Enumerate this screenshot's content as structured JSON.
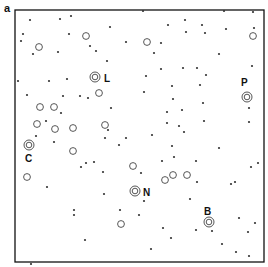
{
  "panel_label": "a",
  "frame": {
    "x": 15,
    "y": 10,
    "w": 249,
    "h": 252,
    "stroke": "#111111"
  },
  "colors": {
    "dot": "#333333",
    "ring": "#444444",
    "label": "#111111"
  },
  "dots": [
    [
      30,
      20
    ],
    [
      60,
      19
    ],
    [
      71,
      16
    ],
    [
      110,
      27
    ],
    [
      126,
      42
    ],
    [
      23,
      34
    ],
    [
      21,
      41
    ],
    [
      33,
      54
    ],
    [
      58,
      52
    ],
    [
      69,
      34
    ],
    [
      90,
      46
    ],
    [
      96,
      51
    ],
    [
      107,
      61
    ],
    [
      18,
      81
    ],
    [
      49,
      81
    ],
    [
      67,
      79
    ],
    [
      27,
      95
    ],
    [
      63,
      96
    ],
    [
      80,
      96
    ],
    [
      88,
      98
    ],
    [
      61,
      113
    ],
    [
      111,
      108
    ],
    [
      46,
      121
    ],
    [
      108,
      130
    ],
    [
      143,
      11
    ],
    [
      185,
      20
    ],
    [
      224,
      11
    ],
    [
      226,
      29
    ],
    [
      202,
      25
    ],
    [
      168,
      25
    ],
    [
      219,
      54
    ],
    [
      253,
      12
    ],
    [
      254,
      28
    ],
    [
      161,
      43
    ],
    [
      186,
      32
    ],
    [
      205,
      33
    ],
    [
      154,
      53
    ],
    [
      161,
      69
    ],
    [
      183,
      68
    ],
    [
      197,
      68
    ],
    [
      252,
      66
    ],
    [
      146,
      76
    ],
    [
      206,
      75
    ],
    [
      172,
      86
    ],
    [
      200,
      85
    ],
    [
      144,
      92
    ],
    [
      249,
      108
    ],
    [
      173,
      99
    ],
    [
      203,
      103
    ],
    [
      167,
      112
    ],
    [
      182,
      110
    ],
    [
      204,
      121
    ],
    [
      167,
      123
    ],
    [
      179,
      126
    ],
    [
      249,
      122
    ],
    [
      184,
      132
    ],
    [
      36,
      136
    ],
    [
      54,
      142
    ],
    [
      105,
      138
    ],
    [
      126,
      138
    ],
    [
      119,
      145
    ],
    [
      94,
      162
    ],
    [
      86,
      163
    ],
    [
      81,
      167
    ],
    [
      103,
      172
    ],
    [
      47,
      187
    ],
    [
      104,
      194
    ],
    [
      74,
      210
    ],
    [
      120,
      210
    ],
    [
      74,
      215
    ],
    [
      85,
      240
    ],
    [
      31,
      264
    ],
    [
      152,
      135
    ],
    [
      172,
      146
    ],
    [
      162,
      161
    ],
    [
      174,
      157
    ],
    [
      196,
      161
    ],
    [
      197,
      182
    ],
    [
      190,
      199
    ],
    [
      219,
      148
    ],
    [
      251,
      167
    ],
    [
      258,
      163
    ],
    [
      141,
      173
    ],
    [
      231,
      184
    ],
    [
      144,
      201
    ],
    [
      139,
      215
    ],
    [
      163,
      228
    ],
    [
      196,
      230
    ],
    [
      235,
      182
    ],
    [
      255,
      223
    ],
    [
      151,
      249
    ],
    [
      171,
      238
    ],
    [
      212,
      231
    ],
    [
      239,
      218
    ],
    [
      248,
      232
    ],
    [
      236,
      252
    ],
    [
      249,
      256
    ],
    [
      222,
      244
    ]
  ],
  "rings": [
    [
      39,
      47
    ],
    [
      86,
      36
    ],
    [
      147,
      42
    ],
    [
      99,
      93
    ],
    [
      40,
      107
    ],
    [
      54,
      107
    ],
    [
      37,
      124
    ],
    [
      55,
      129
    ],
    [
      73,
      128
    ],
    [
      105,
      125
    ],
    [
      27,
      177
    ],
    [
      73,
      151
    ],
    [
      133,
      166
    ],
    [
      165,
      180
    ],
    [
      173,
      175
    ],
    [
      187,
      175
    ],
    [
      121,
      224
    ],
    [
      253,
      36
    ]
  ],
  "labeled_stars": [
    {
      "label": "L",
      "x": 95,
      "y": 77,
      "lx": 104,
      "ly": 82
    },
    {
      "label": "P",
      "x": 247,
      "y": 97,
      "lx": 241,
      "ly": 86
    },
    {
      "label": "C",
      "x": 29,
      "y": 145,
      "lx": 25,
      "ly": 162
    },
    {
      "label": "N",
      "x": 135,
      "y": 191,
      "lx": 143,
      "ly": 196
    },
    {
      "label": "B",
      "x": 209,
      "y": 222,
      "lx": 204,
      "ly": 215
    }
  ]
}
